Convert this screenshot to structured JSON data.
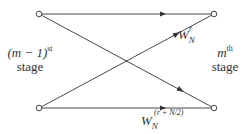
{
  "diagram": {
    "type": "butterfly",
    "colors": {
      "line": "#333333",
      "node_fill": "#ffffff",
      "text": "#333333"
    },
    "nodes": [
      {
        "id": "in_top",
        "x": 39,
        "y": 14
      },
      {
        "id": "in_bottom",
        "x": 39,
        "y": 108
      },
      {
        "id": "out_top",
        "x": 214,
        "y": 14
      },
      {
        "id": "out_bottom",
        "x": 214,
        "y": 108
      }
    ],
    "edges": [
      {
        "from": "in_top",
        "to": "out_top",
        "weight": ""
      },
      {
        "from": "in_top",
        "to": "out_bottom",
        "weight": ""
      },
      {
        "from": "in_bottom",
        "to": "out_top",
        "weight": "W_N^r"
      },
      {
        "from": "in_bottom",
        "to": "out_bottom",
        "weight": "W_N^(r + N/2)"
      }
    ],
    "left_label": {
      "prefix": "(m − 1)",
      "sup": "st",
      "line2": "stage"
    },
    "right_label": {
      "prefix": "m",
      "sup": "th",
      "line2": "stage"
    },
    "twiddle_top": {
      "base": "W",
      "sub": "N",
      "sup": "r"
    },
    "twiddle_bottom": {
      "base": "W",
      "sub": "N",
      "sup": "(r + N/2)"
    }
  }
}
